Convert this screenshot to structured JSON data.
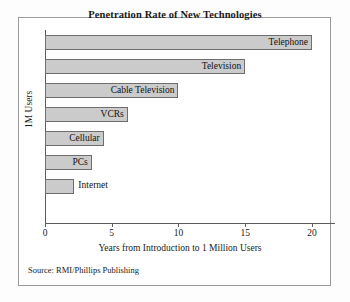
{
  "chart_data": {
    "type": "bar",
    "orientation": "horizontal",
    "title": "Penetration Rate of New Technologies",
    "xlabel": "Years from Introduction to 1 Million Users",
    "ylabel": "1M Users",
    "xlim": [
      0,
      21.5
    ],
    "xticks": [
      "0",
      "5",
      "10",
      "15",
      "20"
    ],
    "xtick_values": [
      0,
      5,
      10,
      15,
      20
    ],
    "grid": false,
    "legend": "none",
    "categories": [
      "Telephone",
      "Television",
      "Cable Television",
      "VCRs",
      "Cellular",
      "PCs",
      "Internet"
    ],
    "values": [
      20,
      15,
      10,
      6.2,
      4.4,
      3.5,
      2.2
    ],
    "bars": [
      {
        "label": "Telephone",
        "value": 20,
        "label_position": "inside"
      },
      {
        "label": "Television",
        "value": 15,
        "label_position": "inside"
      },
      {
        "label": "Cable Television",
        "value": 10,
        "label_position": "inside"
      },
      {
        "label": "VCRs",
        "value": 6.2,
        "label_position": "inside"
      },
      {
        "label": "Cellular",
        "value": 4.4,
        "label_position": "inside"
      },
      {
        "label": "PCs",
        "value": 3.5,
        "label_position": "inside"
      },
      {
        "label": "Internet",
        "value": 2.2,
        "label_position": "outside"
      }
    ],
    "colors": {
      "bar_fill": "#cbcbcb",
      "bar_border": "#6e6e6e",
      "axis": "#5d5d5d",
      "frame": "#9b9b9b",
      "background": "#ffffff",
      "text": "#1a1a1a"
    }
  },
  "source": {
    "text": "Source: RMI/Phillips Publishing"
  }
}
